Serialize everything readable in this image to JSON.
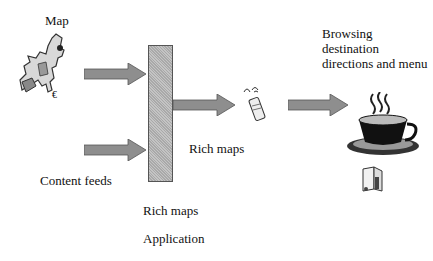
{
  "diagram": {
    "labels": {
      "map": "Map",
      "content_feeds": "Content feeds",
      "rich_maps_mid": "Rich maps",
      "rich_maps_app_line1": "Rich maps",
      "rich_maps_app_line2": "Application",
      "browsing": "Browsing destination directions and menu"
    },
    "nodes": [
      {
        "id": "map",
        "icon": "europe-map-icon"
      },
      {
        "id": "content-feeds",
        "icon": "none"
      },
      {
        "id": "rich-maps-application",
        "shape": "vertical-bar"
      },
      {
        "id": "mobile-device",
        "icon": "mobile-phone-icon"
      },
      {
        "id": "cafe",
        "icon": "coffee-cup-icon"
      },
      {
        "id": "menu",
        "icon": "menu-booklet-icon"
      }
    ],
    "edges": [
      {
        "from": "map",
        "to": "rich-maps-application"
      },
      {
        "from": "content-feeds",
        "to": "rich-maps-application"
      },
      {
        "from": "rich-maps-application",
        "to": "mobile-device",
        "label": "Rich maps"
      },
      {
        "from": "mobile-device",
        "to": "cafe",
        "label": "Browsing destination directions and menu"
      }
    ],
    "colors": {
      "arrow_fill": "#8e8e8e",
      "arrow_stroke": "#555555",
      "bar_fill": "#b5b5b5",
      "text": "#111111"
    }
  }
}
